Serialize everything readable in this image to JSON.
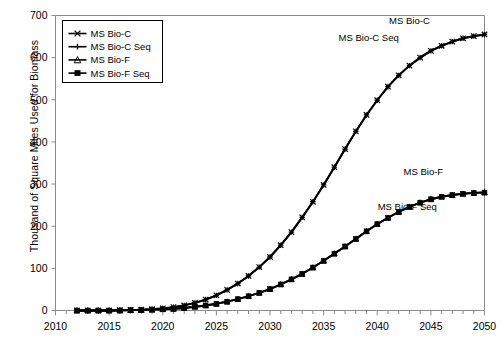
{
  "chart_data": {
    "type": "line",
    "title": "",
    "xlabel": "",
    "ylabel": "Thousand of Square Miles Used for Biomass",
    "xlim": [
      2010,
      2050
    ],
    "ylim": [
      0,
      700
    ],
    "xticks": [
      2010,
      2015,
      2020,
      2025,
      2030,
      2035,
      2040,
      2045,
      2050
    ],
    "xtick_labels": [
      "2010",
      "2015",
      "2020",
      "2025",
      "2030",
      "2035",
      "2040",
      "2045",
      "2050"
    ],
    "minor_xtick_interval": 1,
    "yticks": [
      0,
      100,
      200,
      300,
      400,
      500,
      600,
      700
    ],
    "ytick_labels": [
      "0",
      "100",
      "200",
      "300",
      "400",
      "500",
      "600",
      "700"
    ],
    "grid": false,
    "legend_position": "upper-left",
    "x": [
      2012,
      2013,
      2014,
      2015,
      2016,
      2017,
      2018,
      2019,
      2020,
      2021,
      2022,
      2023,
      2024,
      2025,
      2026,
      2027,
      2028,
      2029,
      2030,
      2031,
      2032,
      2033,
      2034,
      2035,
      2036,
      2037,
      2038,
      2039,
      2040,
      2041,
      2042,
      2043,
      2044,
      2045,
      2046,
      2047,
      2048,
      2049,
      2050
    ],
    "series": [
      {
        "name": "MS Bio-C",
        "marker": "x",
        "values": [
          0,
          0,
          0,
          0,
          1,
          1,
          2,
          3,
          5,
          8,
          12,
          18,
          26,
          36,
          49,
          64,
          82,
          103,
          127,
          155,
          186,
          221,
          258,
          298,
          340,
          383,
          425,
          464,
          499,
          531,
          558,
          581,
          600,
          616,
          628,
          638,
          646,
          651,
          655
        ]
      },
      {
        "name": "MS Bio-C Seq",
        "marker": "plus",
        "values": [
          0,
          0,
          0,
          0,
          1,
          1,
          2,
          3,
          5,
          8,
          12,
          18,
          26,
          36,
          49,
          64,
          82,
          103,
          127,
          155,
          186,
          221,
          258,
          298,
          340,
          383,
          425,
          464,
          499,
          531,
          558,
          581,
          600,
          616,
          628,
          638,
          646,
          651,
          655
        ]
      },
      {
        "name": "MS Bio-F",
        "marker": "triangle",
        "values": [
          0,
          0,
          0,
          0,
          0,
          1,
          1,
          2,
          3,
          4,
          6,
          9,
          12,
          16,
          21,
          27,
          34,
          42,
          51,
          62,
          74,
          87,
          102,
          118,
          135,
          152,
          170,
          188,
          205,
          220,
          234,
          246,
          256,
          264,
          270,
          274,
          277,
          279,
          280
        ]
      },
      {
        "name": "MS Bio-F Seq",
        "marker": "square",
        "values": [
          0,
          0,
          0,
          0,
          0,
          1,
          1,
          2,
          3,
          4,
          6,
          9,
          12,
          16,
          21,
          27,
          34,
          42,
          51,
          62,
          74,
          87,
          102,
          118,
          135,
          152,
          170,
          188,
          205,
          220,
          234,
          246,
          256,
          264,
          270,
          274,
          277,
          279,
          280
        ]
      }
    ],
    "annotations": [
      {
        "text": "MS Bio-C",
        "x": 2043.0,
        "y": 680
      },
      {
        "text": "MS Bio-C Seq",
        "x": 2039.2,
        "y": 640
      },
      {
        "text": "MS Bio-F",
        "x": 2044.3,
        "y": 322
      },
      {
        "text": "MS Bio-F Seq",
        "x": 2042.8,
        "y": 238
      }
    ],
    "colors": {
      "line": "#000000",
      "axis": "#8a8a8a",
      "background": "#ffffff"
    }
  },
  "legend": {
    "entries": [
      {
        "label": "MS Bio-C",
        "marker": "x"
      },
      {
        "label": "MS Bio-C Seq",
        "marker": "plus"
      },
      {
        "label": "MS Bio-F",
        "marker": "triangle"
      },
      {
        "label": "MS Bio-F Seq",
        "marker": "square"
      }
    ]
  }
}
